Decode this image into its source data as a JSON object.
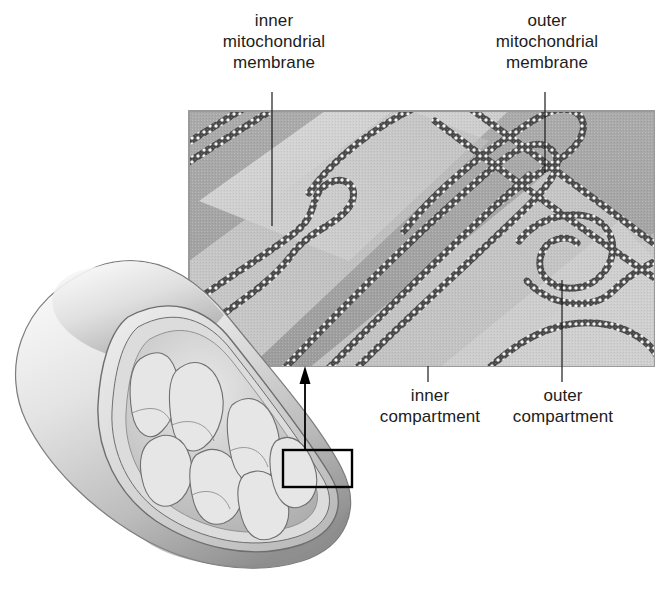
{
  "figure": {
    "type": "labeled-diagram",
    "background_color": "#ffffff",
    "text_color": "#1c1c1c"
  },
  "labels": {
    "inner_membrane": "inner\nmitochondrial\nmembrane",
    "outer_membrane": "outer\nmitochondrial\nmembrane",
    "inner_compartment": "inner\ncompartment",
    "outer_compartment": "outer\ncompartment"
  },
  "inset": {
    "caption_role": "electron-micrograph magnification",
    "border_color": "#9a9a9a",
    "matrix_color": "#d6d6d6",
    "outer_compartment_color": "#a8a8a8",
    "membrane_color": "#4a4a4a",
    "highlight_color": "#f2f2f2"
  },
  "organelle": {
    "outline_color": "#6e6e6e",
    "body_light": "#f0f0f0",
    "body_mid": "#c4c4c4",
    "body_shadow": "#8f8f8f",
    "callout_box_color": "#000000",
    "arrow_color": "#000000"
  },
  "leaders": {
    "inner_membrane_line": "vertical leader from label to inner membrane",
    "outer_membrane_line": "vertical leader from label to outer membrane",
    "inner_compartment_line": "vertical leader from label to matrix space",
    "outer_compartment_line": "vertical leader from label to intermembrane space"
  }
}
